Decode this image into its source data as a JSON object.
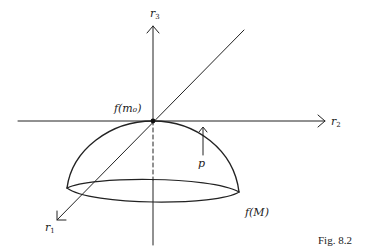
{
  "figure": {
    "caption": "Fig. 8.2",
    "labels": {
      "r3": {
        "base": "r",
        "sub": "3"
      },
      "r2": {
        "base": "r",
        "sub": "2"
      },
      "r1": {
        "base": "r",
        "sub": "1"
      },
      "f_m0": "f(m₀)",
      "p": "p",
      "f_M": "f(M)"
    },
    "colors": {
      "stroke": "#222222",
      "background": "#ffffff"
    }
  }
}
